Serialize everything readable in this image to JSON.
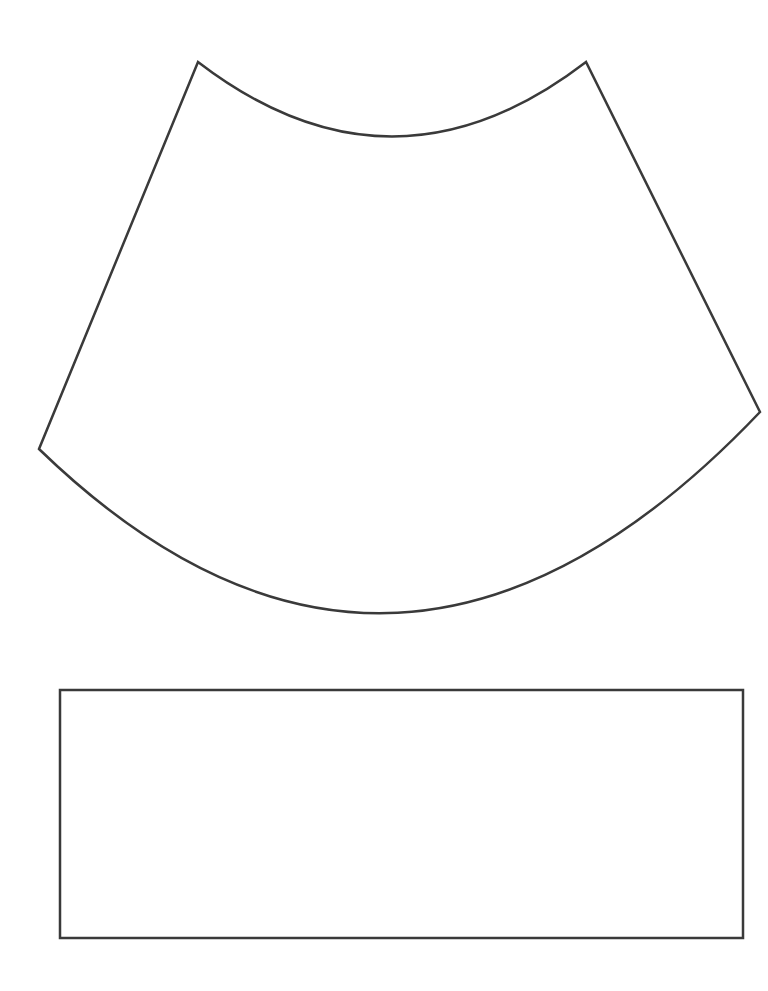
{
  "page": {
    "width": 768,
    "height": 991,
    "background_color": "#ffffff",
    "stroke_color": "#3a3a3a",
    "stroke_width": 2.5
  },
  "shapes": {
    "cone_panel": {
      "name": "curved-cone-panel",
      "stroke_color": "#3a3a3a",
      "stroke_width": 2.5,
      "fill": "none",
      "vertices": {
        "top_left_peak": [
          198,
          62
        ],
        "top_right_peak": [
          586,
          62
        ],
        "left_vertex": [
          39,
          449
        ],
        "right_vertex": [
          760,
          412
        ]
      },
      "top_arc": {
        "type": "concave-down-dip",
        "from": [
          198,
          62
        ],
        "to": [
          586,
          62
        ],
        "lowest_point": [
          390,
          148
        ],
        "sagitta": 86
      },
      "bottom_arc": {
        "type": "convex-downward",
        "from": [
          39,
          449
        ],
        "to": [
          760,
          412
        ],
        "lowest_point": [
          387,
          641
        ],
        "sagitta": 210
      },
      "path": "M 198 62 Q 392 211 586 62 L 760 412 Q 396 795 39 449 Z"
    },
    "rectangle_panel": {
      "name": "rectangle-panel",
      "stroke_color": "#3a3a3a",
      "stroke_width": 2.5,
      "fill": "none",
      "x": 60,
      "y": 690,
      "width": 683,
      "height": 248,
      "corners": {
        "top_left": [
          60,
          690
        ],
        "top_right": [
          743,
          690
        ],
        "bottom_right": [
          743,
          938
        ],
        "bottom_left": [
          60,
          938
        ]
      }
    }
  }
}
